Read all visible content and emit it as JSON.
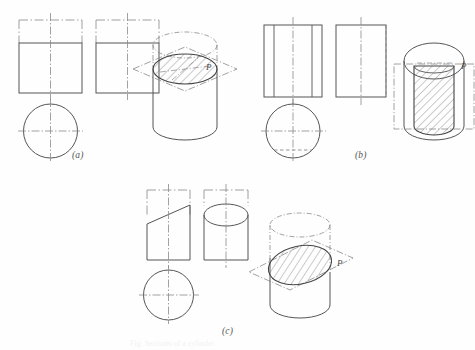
{
  "figure": {
    "background_color": "#fefefe",
    "line_color": "#555555",
    "thin_line_color": "#777777",
    "hatch_color": "#6a6a6a",
    "caption": "Fig. Sections of a cylinder",
    "panels": [
      {
        "id": "a",
        "label": "(a)",
        "plane_label": "P",
        "plane_orientation": "horizontal",
        "section_shape": "circle",
        "description": "Plane P perpendicular to cylinder axis cuts a circular section",
        "views": [
          {
            "name": "front-view",
            "outline": "rectangle",
            "cut_line": "horizontal"
          },
          {
            "name": "side-view",
            "outline": "rectangle",
            "cut_line": "horizontal"
          },
          {
            "name": "top-view",
            "outline": "circle",
            "cut_line": "full-circle"
          }
        ]
      },
      {
        "id": "b",
        "label": "(b)",
        "plane_label": "P",
        "plane_orientation": "vertical",
        "section_shape": "rectangle",
        "description": "Plane P parallel to cylinder axis cuts a rectangular section",
        "views": [
          {
            "name": "front-view",
            "outline": "rectangle",
            "cut_line": "two-vertical"
          },
          {
            "name": "side-view",
            "outline": "rectangle",
            "cut_line": "vertical-hidden"
          },
          {
            "name": "top-view",
            "outline": "circle",
            "cut_line": "chord"
          }
        ]
      },
      {
        "id": "c",
        "label": "(c)",
        "plane_label": "P",
        "plane_orientation": "oblique",
        "section_shape": "ellipse",
        "description": "Plane P inclined to cylinder axis cuts an elliptical section",
        "views": [
          {
            "name": "front-view",
            "outline": "truncated-rectangle",
            "cut_line": "inclined"
          },
          {
            "name": "side-view",
            "outline": "rectangle-with-ellipse",
            "cut_line": "ellipse"
          },
          {
            "name": "top-view",
            "outline": "circle",
            "cut_line": "full-circle"
          }
        ]
      }
    ]
  }
}
